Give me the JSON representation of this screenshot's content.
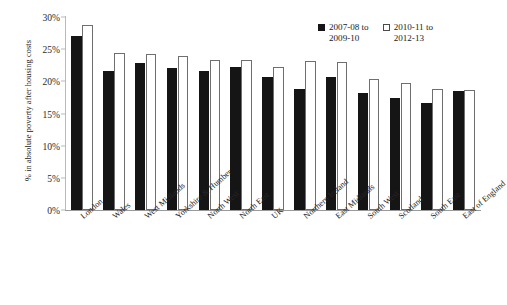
{
  "chart_data": {
    "type": "bar",
    "title": "",
    "subtitle": "",
    "xlabel": "",
    "ylabel": "% in absolute poverty after housing costs",
    "ylim": [
      0,
      30
    ],
    "ytick_labels": [
      "30%",
      "25%",
      "20%",
      "15%",
      "10%",
      "5%",
      "0%"
    ],
    "ytick_values": [
      30,
      25,
      20,
      15,
      10,
      5,
      0
    ],
    "grid": false,
    "legend_position": "top-right",
    "categories": [
      "London",
      "Wales",
      "West Midlands",
      "Yorkshire & Humber",
      "North West",
      "North East",
      "UK",
      "Northern Ireland",
      "East Midlands",
      "South West",
      "Scotland",
      "South East",
      "East of England"
    ],
    "series": [
      {
        "name": "2007-08 to 2009-10",
        "color": "#151515",
        "values": [
          27.1,
          21.6,
          22.9,
          22.0,
          21.6,
          22.2,
          20.7,
          18.8,
          20.6,
          18.2,
          17.4,
          16.6,
          18.5
        ]
      },
      {
        "name": "2010-11 to 2012-13",
        "color": "#ffffff",
        "values": [
          28.7,
          24.4,
          24.2,
          24.0,
          23.3,
          23.3,
          22.2,
          23.2,
          23.0,
          20.3,
          19.7,
          18.8,
          18.6
        ]
      }
    ]
  },
  "legend": {
    "entries": [
      {
        "line1": "2007-08 to",
        "line2": "2009-10",
        "swatch": "filled-square-icon"
      },
      {
        "line1": "2010-11 to",
        "line2": "2012-13",
        "swatch": "empty-square-icon"
      }
    ]
  }
}
